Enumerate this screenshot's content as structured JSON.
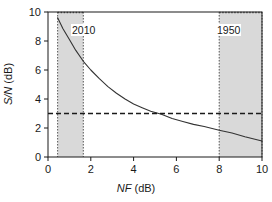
{
  "chart_data": {
    "type": "line",
    "title": "",
    "xlabel": "NF (dB)",
    "xlabel_italic": "NF",
    "xlabel_plain": " (dB)",
    "ylabel": "S/N (dB)",
    "ylabel_italic": "S/N",
    "ylabel_plain": " (dB)",
    "xlim": [
      0,
      10
    ],
    "ylim": [
      0,
      10
    ],
    "xticks": [
      0,
      2,
      4,
      6,
      8,
      10
    ],
    "xtick_labels": [
      "0",
      "2",
      "4",
      "6",
      "8",
      "10"
    ],
    "yticks": [
      0,
      2,
      4,
      6,
      8,
      10
    ],
    "ytick_labels": [
      "0",
      "2",
      "4",
      "6",
      "8",
      "10"
    ],
    "grid": false,
    "legend": false,
    "series": [
      {
        "name": "S/N vs NF",
        "style": "solid",
        "color": "#333333",
        "x": [
          0.45,
          0.7,
          1.0,
          1.3,
          1.65,
          2.0,
          2.4,
          2.8,
          3.2,
          3.6,
          4.0,
          4.4,
          4.8,
          5.3,
          5.8,
          6.3,
          6.8,
          7.3,
          8.0,
          8.6,
          9.2,
          10.0
        ],
        "y": [
          9.6,
          8.85,
          8.1,
          7.35,
          6.6,
          6.0,
          5.4,
          4.85,
          4.4,
          4.0,
          3.65,
          3.4,
          3.15,
          2.95,
          2.65,
          2.45,
          2.25,
          2.1,
          1.85,
          1.65,
          1.4,
          1.1
        ]
      }
    ],
    "reference_lines": [
      {
        "name": "snr-threshold",
        "orientation": "horizontal",
        "value": 3,
        "style": "dashed",
        "color": "#1a1a1a"
      }
    ],
    "shaded_bands": [
      {
        "name": "band-2010",
        "label": "2010",
        "x_start": 0.45,
        "x_end": 1.65,
        "color": "#d9d9d9",
        "border_style": "dotted"
      },
      {
        "name": "band-1950",
        "label": "1950",
        "x_start": 8.0,
        "x_end": 10.0,
        "color": "#d9d9d9",
        "border_style": "dotted"
      }
    ],
    "colors": {
      "axis": "#1a1a1a",
      "curve": "#333333",
      "band_fill": "#d9d9d9",
      "band_border": "#555555",
      "background": "#ffffff"
    }
  },
  "labels": {
    "band_2010": "2010",
    "band_1950": "1950"
  }
}
